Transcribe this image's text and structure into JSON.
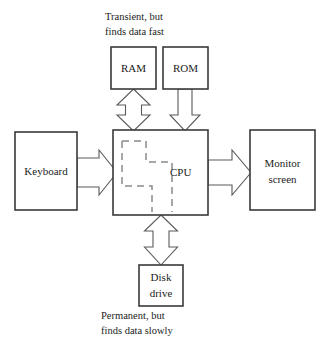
{
  "diagram": {
    "style": {
      "background": "#ffffff",
      "box_stroke": "#3a3a3a",
      "arrow_stroke": "#5a5a5a",
      "dashed_stroke": "#8a8a8a",
      "text_color": "#1c1c1c"
    },
    "boxes": [
      {
        "id": "ram",
        "label": "RAM",
        "lines": [
          "RAM"
        ],
        "x": 111,
        "y": 47,
        "w": 45,
        "h": 42
      },
      {
        "id": "rom",
        "label": "ROM",
        "lines": [
          "ROM"
        ],
        "x": 163,
        "y": 47,
        "w": 45,
        "h": 42
      },
      {
        "id": "keyboard",
        "label": "Keyboard",
        "lines": [
          "Keyboard"
        ],
        "x": 15,
        "y": 132,
        "w": 62,
        "h": 78
      },
      {
        "id": "cpu",
        "label": "CPU",
        "lines": [
          "CPU"
        ],
        "x": 113,
        "y": 130,
        "w": 95,
        "h": 85
      },
      {
        "id": "monitor",
        "label": "Monitor screen",
        "lines": [
          "Monitor",
          "screen"
        ],
        "x": 250,
        "y": 130,
        "w": 65,
        "h": 80
      },
      {
        "id": "disk",
        "label": "Disk drive",
        "lines": [
          "Disk",
          "drive"
        ],
        "x": 139,
        "y": 265,
        "w": 44,
        "h": 41
      }
    ],
    "arrows": [
      {
        "id": "ram-cpu",
        "from": "ram",
        "to": "cpu",
        "direction": "bidirectional",
        "orientation": "vertical"
      },
      {
        "id": "rom-cpu",
        "from": "rom",
        "to": "cpu",
        "direction": "down",
        "orientation": "vertical"
      },
      {
        "id": "keyboard-cpu",
        "from": "keyboard",
        "to": "cpu",
        "direction": "right",
        "orientation": "horizontal"
      },
      {
        "id": "cpu-monitor",
        "from": "cpu",
        "to": "monitor",
        "direction": "right",
        "orientation": "horizontal"
      },
      {
        "id": "cpu-disk",
        "from": "cpu",
        "to": "disk",
        "direction": "bidirectional",
        "orientation": "vertical"
      }
    ],
    "captions": [
      {
        "id": "top-caption",
        "lines": [
          "Transient, but",
          "finds data fast"
        ],
        "x": 105,
        "y": 18
      },
      {
        "id": "bottom-caption",
        "lines": [
          "Permanent, but",
          "finds data slowly"
        ],
        "x": 101,
        "y": 315
      }
    ],
    "internal_bus": {
      "id": "cpu-internal-bus",
      "description": "dashed internal data path inside CPU"
    }
  }
}
